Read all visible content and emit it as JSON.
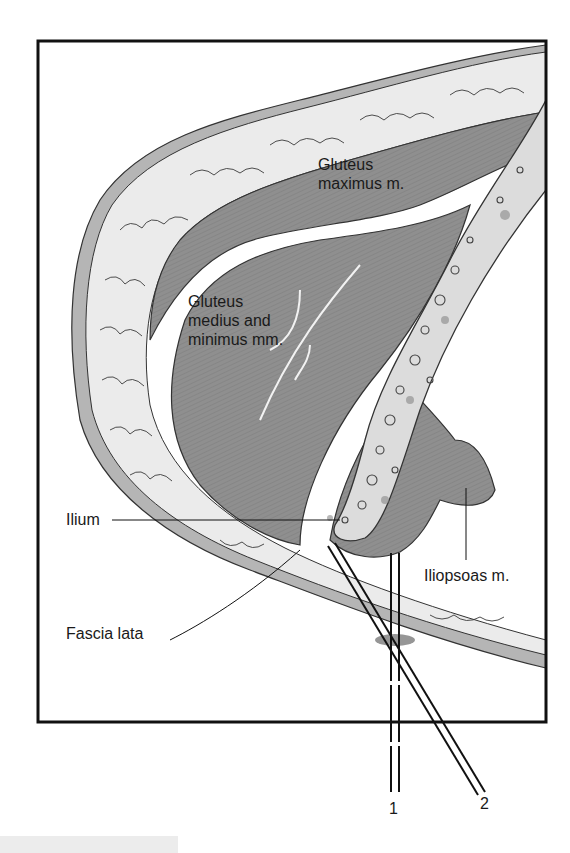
{
  "figure": {
    "labels": {
      "gluteus_maximus": "Gluteus\nmaximus m.",
      "gluteus_medius_minimus": "Gluteus\nmedius and\nminimus mm.",
      "ilium": "Ilium",
      "iliopsoas": "Iliopsoas m.",
      "fascia_lata": "Fascia lata"
    },
    "needles": {
      "needle_1": "1",
      "needle_2": "2"
    },
    "colors": {
      "frame": "#111111",
      "fat": "#e6e6e6",
      "muscle": "#8f8f8f",
      "muscle_dark": "#7c7c7c",
      "bone": "#d8d8d8",
      "fascia": "#b3b3b3"
    }
  }
}
